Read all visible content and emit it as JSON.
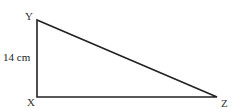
{
  "diagram": {
    "type": "right-triangle",
    "stroke_color": "#222222",
    "stroke_width": 1.6,
    "vertices": {
      "X": {
        "label": "X",
        "x": 37,
        "y": 97
      },
      "Y": {
        "label": "Y",
        "x": 37,
        "y": 20
      },
      "Z": {
        "label": "Z",
        "x": 217,
        "y": 97
      }
    },
    "labels": {
      "Y": "Y",
      "X": "X",
      "Z": "Z",
      "side_XY": "14 cm"
    }
  }
}
